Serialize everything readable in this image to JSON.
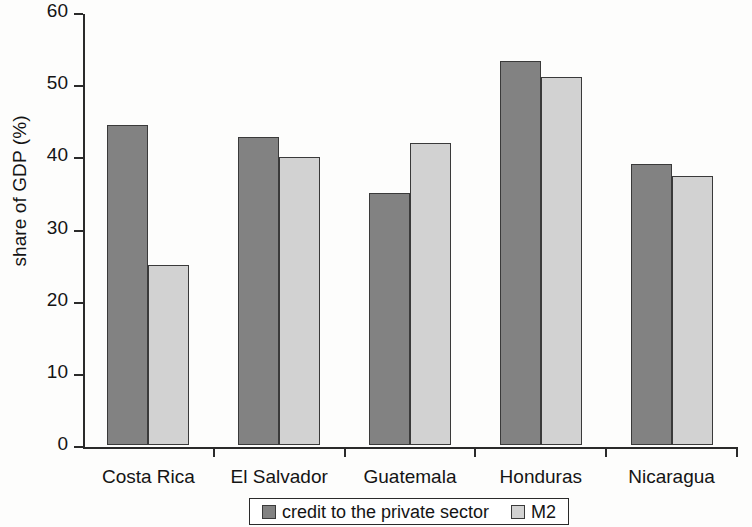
{
  "chart_data": {
    "type": "bar",
    "title": "",
    "subtitle": "",
    "xlabel": "",
    "ylabel": "share of GDP (%)",
    "categories": [
      "Costa Rica",
      "El Salvador",
      "Guatemala",
      "Honduras",
      "Nicaragua"
    ],
    "series": [
      {
        "name": "credit to the private sector",
        "color": "#828282",
        "values": [
          44.4,
          42.7,
          34.9,
          53.2,
          38.9
        ]
      },
      {
        "name": "M2",
        "color": "#d2d2d2",
        "values": [
          25.0,
          39.9,
          41.9,
          51.0,
          37.3
        ]
      }
    ],
    "ylim": [
      0,
      60
    ],
    "ytick_labels": [
      "0",
      "10",
      "20",
      "30",
      "40",
      "50",
      "60"
    ],
    "ytick_values": [
      0,
      10,
      20,
      30,
      40,
      50,
      60
    ],
    "grid": false,
    "legend_position": "bottom",
    "legend_entries": [
      {
        "label": "credit to the private sector",
        "color": "#828282"
      },
      {
        "label": "M2",
        "color": "#d2d2d2"
      }
    ],
    "axis_color": "#2a2a2a",
    "background_color": "#fdfdfc"
  }
}
